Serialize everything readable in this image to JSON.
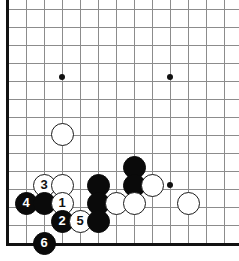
{
  "diagram": {
    "type": "go-board-diagram",
    "board": {
      "cols": 13,
      "rows": 14,
      "origin_x": 8,
      "origin_y": 11,
      "spacing": 18,
      "left_edge_x": 7,
      "bottom_edge_y": 243,
      "line_color": "#8c8c8c",
      "edge_color": "#111111",
      "background": "#ffffff"
    },
    "star_points": [
      {
        "name": "star-point-left",
        "x": 62,
        "y": 77
      },
      {
        "name": "star-point-right",
        "x": 170,
        "y": 77
      },
      {
        "name": "star-point-lower-right",
        "x": 170,
        "y": 185
      }
    ],
    "stones": [
      {
        "name": "white-stone-upper-left-area",
        "color": "white",
        "label": "",
        "x": 62,
        "y": 134
      },
      {
        "name": "black-stone-upper-right-group",
        "color": "black",
        "label": "",
        "x": 134,
        "y": 167
      },
      {
        "name": "black-stone-center-upper",
        "color": "black",
        "label": "",
        "x": 98,
        "y": 185
      },
      {
        "name": "black-stone-right-upper",
        "color": "black",
        "label": "",
        "x": 134,
        "y": 185
      },
      {
        "name": "white-stone-right-of-black",
        "color": "white",
        "label": "",
        "x": 152,
        "y": 185
      },
      {
        "name": "white-stone-move-3",
        "color": "white",
        "label": "3",
        "x": 44,
        "y": 185
      },
      {
        "name": "white-stone-plain-top",
        "color": "white",
        "label": "",
        "x": 62,
        "y": 185
      },
      {
        "name": "black-stone-move-4",
        "color": "black",
        "label": "4",
        "x": 26,
        "y": 203
      },
      {
        "name": "black-stone-plain-left",
        "color": "black",
        "label": "",
        "x": 44,
        "y": 203
      },
      {
        "name": "white-stone-move-1",
        "color": "white",
        "label": "1",
        "x": 62,
        "y": 203
      },
      {
        "name": "black-stone-center-mid",
        "color": "black",
        "label": "",
        "x": 98,
        "y": 203
      },
      {
        "name": "white-stone-mid-right-a",
        "color": "white",
        "label": "",
        "x": 116,
        "y": 203
      },
      {
        "name": "white-stone-mid-right-b",
        "color": "white",
        "label": "",
        "x": 134,
        "y": 203
      },
      {
        "name": "white-stone-far-right",
        "color": "white",
        "label": "",
        "x": 188,
        "y": 203
      },
      {
        "name": "black-stone-move-2",
        "color": "black",
        "label": "2",
        "x": 62,
        "y": 221
      },
      {
        "name": "white-stone-move-5",
        "color": "white",
        "label": "5",
        "x": 80,
        "y": 221
      },
      {
        "name": "black-stone-bottom-center",
        "color": "black",
        "label": "",
        "x": 98,
        "y": 221
      },
      {
        "name": "black-stone-move-6",
        "color": "black",
        "label": "6",
        "x": 44,
        "y": 243
      }
    ]
  }
}
